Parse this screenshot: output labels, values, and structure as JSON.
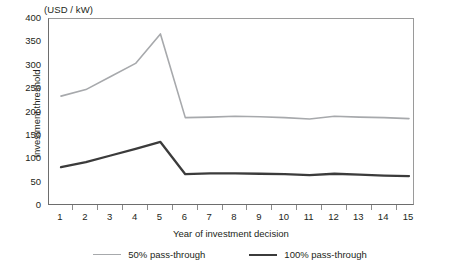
{
  "chart_data": {
    "type": "line",
    "title": "",
    "unit_caption": "(USD / kW)",
    "xlabel": "Year of investment decision",
    "ylabel": "Investment threshold",
    "x": [
      1,
      2,
      3,
      4,
      5,
      6,
      7,
      8,
      9,
      10,
      11,
      12,
      13,
      14,
      15
    ],
    "xtick_labels": [
      "1",
      "2",
      "3",
      "4",
      "5",
      "6",
      "7",
      "8",
      "9",
      "10",
      "11",
      "12",
      "13",
      "14",
      "15"
    ],
    "ytick_labels": [
      "0",
      "50",
      "100",
      "150",
      "200",
      "250",
      "300",
      "350",
      "400"
    ],
    "ytick_values": [
      0,
      50,
      100,
      150,
      200,
      250,
      300,
      350,
      400
    ],
    "ylim": [
      0,
      400
    ],
    "xlim": [
      1,
      15
    ],
    "grid": false,
    "legend_position": "below",
    "series": [
      {
        "name": "50% pass-through",
        "color": "#a7a9ac",
        "width": 1.6,
        "values": [
          235,
          249,
          277,
          305,
          368,
          189,
          190,
          192,
          191,
          189,
          186,
          192,
          190,
          189,
          187
        ]
      },
      {
        "name": "100% pass-through",
        "color": "#3b3b3b",
        "width": 2.3,
        "values": [
          83,
          94,
          108,
          122,
          137,
          68,
          70,
          70,
          69,
          68,
          66,
          69,
          67,
          65,
          64
        ]
      }
    ]
  },
  "legend": {
    "items": [
      {
        "label": "50% pass-through",
        "style": "thin"
      },
      {
        "label": "100% pass-through",
        "style": "thick"
      }
    ]
  }
}
